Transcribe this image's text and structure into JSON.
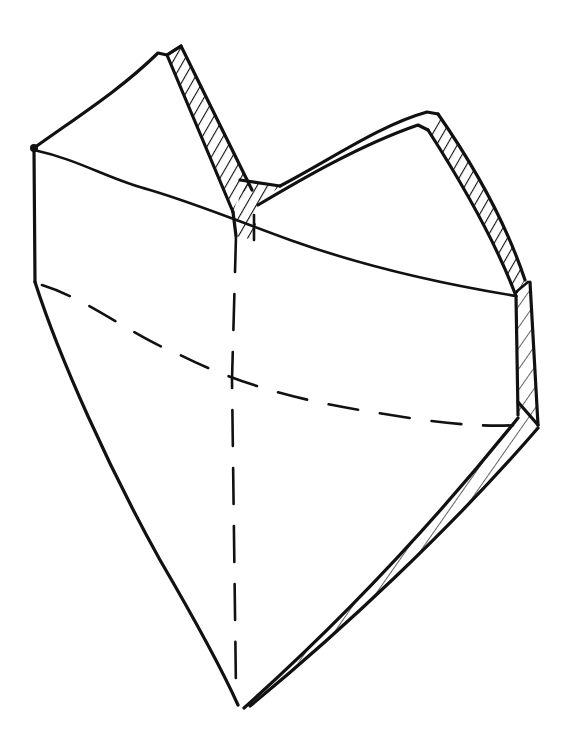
{
  "figure": {
    "background": "#ffffff",
    "ink_color": "#111111",
    "style": "pen line drawing with hatched thickness bands and dashed hidden edges",
    "parts": [
      {
        "name": "left-top-lobe-face"
      },
      {
        "name": "right-top-lobe-face"
      },
      {
        "name": "left-front-face"
      },
      {
        "name": "right-front-face"
      },
      {
        "name": "hatched-thickness-edges"
      },
      {
        "name": "dashed-hidden-edges"
      }
    ]
  }
}
